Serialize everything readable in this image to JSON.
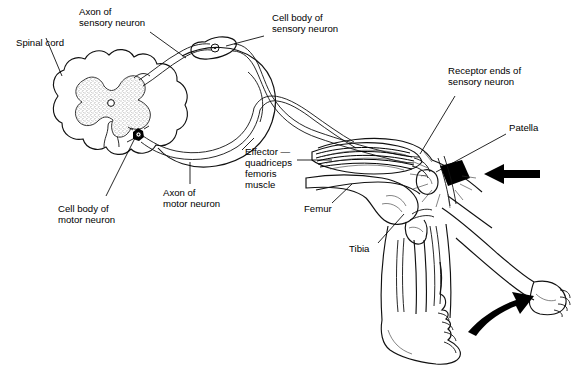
{
  "figure": {
    "background_color": "#ffffff",
    "line_color": "#000000",
    "gray_matter_fill": "#ffffff",
    "gray_matter_stipple_color": "#333333"
  },
  "labels": {
    "spinal_cord": "Spinal cord",
    "axon_sensory_line1": "Axon of",
    "axon_sensory_line2": "sensory neuron",
    "cell_body_sensory_line1": "Cell body of",
    "cell_body_sensory_line2": "sensory neuron",
    "cell_body_motor_line1": "Cell body of",
    "cell_body_motor_line2": "motor neuron",
    "axon_motor_line1": "Axon of",
    "axon_motor_line2": "motor neuron",
    "effector_line1": "Effector —",
    "effector_line2": "quadriceps",
    "effector_line3": "femoris",
    "effector_line4": "muscle",
    "receptor_ends_line1": "Receptor ends of",
    "receptor_ends_line2": "sensory neuron",
    "patella": "Patella",
    "femur": "Femur",
    "tibia": "Tibia"
  },
  "structures": {
    "spinal_cord_section": "spinal-cord-cross-section",
    "gray_matter": "butterfly-gray-matter",
    "central_canal": "central-canal",
    "dorsal_root_ganglion": "dorsal-root-ganglion",
    "sensory_cell_body": "sensory-neuron-cell-body",
    "motor_cell_body": "motor-neuron-cell-body",
    "spinal_nerve": "spinal-nerve-loop",
    "quadriceps_muscle": "quadriceps-femoris-muscle",
    "knee_joint": "knee-joint",
    "patella_bone": "patella-bone",
    "femur_bone": "femur-bone",
    "tibia_bone": "tibia-bone",
    "fibula_bone": "fibula-bone",
    "foot_resting": "resting-foot",
    "foot_kicking": "kicking-foot",
    "reflex_hammer": "reflex-hammer-head",
    "strike_arrow": "hammer-strike-arrow",
    "kick_arrow": "leg-kick-arrow",
    "impact_rays": "impact-radiating-lines"
  }
}
